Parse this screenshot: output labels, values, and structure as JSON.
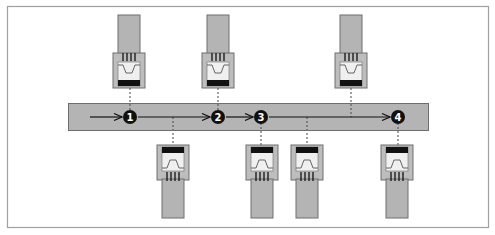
{
  "diagram": {
    "title": "",
    "colors": {
      "frame": "#a0a0a0",
      "bus_fill": "#b4b4b4",
      "bus_stroke": "#6e6e6e",
      "cable_fill": "#b4b4b4",
      "housing_fill": "#bdbdbd",
      "jack_face": "#f0f0f0",
      "jack_bar": "#111111",
      "marker_fill": "#111111",
      "line": "#111111",
      "dotted": "#555555"
    },
    "markers": [
      {
        "label": "1",
        "x": 130
      },
      {
        "label": "2",
        "x": 218
      },
      {
        "label": "3",
        "x": 261
      },
      {
        "label": "4",
        "x": 398
      }
    ],
    "top_connectors": [
      {
        "id": "top-1",
        "x": 129
      },
      {
        "id": "top-2",
        "x": 218
      },
      {
        "id": "top-3",
        "x": 351
      }
    ],
    "bottom_connectors": [
      {
        "id": "bottom-1",
        "x": 173
      },
      {
        "id": "bottom-2",
        "x": 262
      },
      {
        "id": "bottom-3",
        "x": 307
      },
      {
        "id": "bottom-4",
        "x": 397
      }
    ]
  }
}
